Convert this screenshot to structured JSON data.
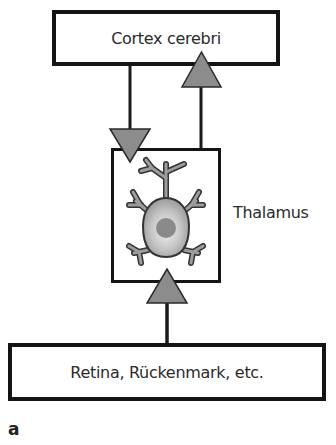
{
  "diagram": {
    "nodes": {
      "cortex": {
        "label": "Cortex cerebri"
      },
      "thalamus": {
        "label": "Thalamus"
      },
      "input": {
        "label": "Retina, Rückenmark, etc."
      }
    },
    "edges": [
      {
        "from": "input",
        "to": "thalamus",
        "arrow": "up-triangle"
      },
      {
        "from": "thalamus",
        "to": "cortex",
        "arrow": "up-triangle"
      },
      {
        "from": "cortex",
        "to": "thalamus",
        "arrow": "down-triangle"
      }
    ],
    "panel_label": "a",
    "colors": {
      "box_border": "#141414",
      "arrow_fill": "#8c8c8c",
      "neuron_fill": "#a8a8a8",
      "neuron_outline": "#333333",
      "nucleus": "#8a8a8a"
    }
  }
}
